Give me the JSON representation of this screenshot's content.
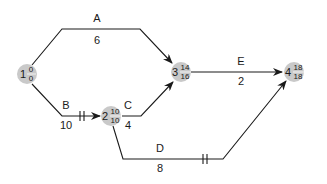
{
  "diagram": {
    "type": "activity-on-arrow network",
    "nodes": [
      {
        "id": "1",
        "earliest": "0",
        "latest": "0"
      },
      {
        "id": "2",
        "earliest": "10",
        "latest": "10"
      },
      {
        "id": "3",
        "earliest": "14",
        "latest": "16"
      },
      {
        "id": "4",
        "earliest": "18",
        "latest": "18"
      }
    ],
    "activities": [
      {
        "name": "A",
        "duration": "6",
        "from": "1",
        "to": "3",
        "critical": false
      },
      {
        "name": "B",
        "duration": "10",
        "from": "1",
        "to": "2",
        "critical": true
      },
      {
        "name": "C",
        "duration": "4",
        "from": "2",
        "to": "3",
        "critical": false
      },
      {
        "name": "D",
        "duration": "8",
        "from": "2",
        "to": "4",
        "critical": true
      },
      {
        "name": "E",
        "duration": "2",
        "from": "3",
        "to": "4",
        "critical": false
      }
    ],
    "colors": {
      "node_fill": "#c9c9c9",
      "line": "#1a1a1a"
    }
  }
}
